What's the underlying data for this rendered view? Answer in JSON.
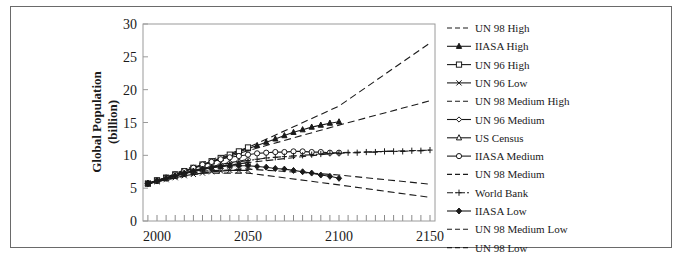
{
  "chart_data": {
    "type": "line",
    "title": "",
    "xlabel": "",
    "ylabel": "Global Population (billion)",
    "ylabel_lines": [
      "Global Population",
      "(billion)"
    ],
    "xlim": [
      1995,
      2150
    ],
    "ylim": [
      0,
      30
    ],
    "xticks": [
      2000,
      2050,
      2100,
      2150
    ],
    "yticks": [
      0,
      5,
      10,
      15,
      20,
      25,
      30
    ],
    "minor_xtick_step": 5,
    "grid": false,
    "legend_position": "right",
    "series": [
      {
        "name": "UN 98 High",
        "style": "dash",
        "marker": "none",
        "x": [
          1995,
          2000,
          2025,
          2050,
          2100,
          2150
        ],
        "y": [
          5.7,
          6.1,
          8.9,
          11.2,
          17.5,
          27.1
        ]
      },
      {
        "name": "IIASA High",
        "style": "solid",
        "marker": "triangle-filled",
        "x": [
          1995,
          2000,
          2005,
          2010,
          2015,
          2020,
          2025,
          2030,
          2035,
          2040,
          2045,
          2050,
          2055,
          2060,
          2065,
          2070,
          2075,
          2080,
          2085,
          2090,
          2095,
          2100
        ],
        "y": [
          5.7,
          6.1,
          6.5,
          7.0,
          7.5,
          8.0,
          8.5,
          9.0,
          9.5,
          10.0,
          10.5,
          11.0,
          11.5,
          12.0,
          12.5,
          13.0,
          13.5,
          13.9,
          14.3,
          14.6,
          14.9,
          15.1
        ]
      },
      {
        "name": "UN 96 High",
        "style": "solid",
        "marker": "square-open",
        "x": [
          1995,
          2000,
          2005,
          2010,
          2015,
          2020,
          2025,
          2030,
          2035,
          2040,
          2045,
          2050
        ],
        "y": [
          5.7,
          6.2,
          6.6,
          7.1,
          7.6,
          8.1,
          8.6,
          9.1,
          9.6,
          10.1,
          10.6,
          11.2
        ]
      },
      {
        "name": "UN 96 Low",
        "style": "solid",
        "marker": "x",
        "x": [
          1995,
          2000,
          2005,
          2010,
          2015,
          2020,
          2025,
          2030,
          2035,
          2040,
          2045,
          2050
        ],
        "y": [
          5.7,
          6.0,
          6.3,
          6.6,
          6.9,
          7.1,
          7.3,
          7.5,
          7.6,
          7.7,
          7.7,
          7.7
        ]
      },
      {
        "name": "UN 98 Medium High",
        "style": "dash",
        "marker": "none",
        "x": [
          1995,
          2000,
          2025,
          2050,
          2100,
          2150
        ],
        "y": [
          5.7,
          6.1,
          8.6,
          10.7,
          14.6,
          18.3
        ]
      },
      {
        "name": "UN 96 Medium",
        "style": "solid",
        "marker": "diamond-open",
        "x": [
          1995,
          2000,
          2005,
          2010,
          2015,
          2020,
          2025,
          2030,
          2035,
          2040,
          2045,
          2050
        ],
        "y": [
          5.7,
          6.1,
          6.5,
          6.9,
          7.3,
          7.7,
          8.0,
          8.3,
          8.6,
          8.9,
          9.1,
          9.4
        ]
      },
      {
        "name": "US Census",
        "style": "solid",
        "marker": "triangle-open",
        "x": [
          1995,
          2000,
          2005,
          2010,
          2015,
          2020,
          2025,
          2030,
          2035,
          2040,
          2045,
          2050
        ],
        "y": [
          5.7,
          6.1,
          6.5,
          6.8,
          7.2,
          7.5,
          7.8,
          8.1,
          8.3,
          8.5,
          8.7,
          8.9
        ]
      },
      {
        "name": "IIASA Medium",
        "style": "solid",
        "marker": "circle-open",
        "x": [
          1995,
          2000,
          2005,
          2010,
          2015,
          2020,
          2025,
          2030,
          2035,
          2040,
          2045,
          2050,
          2055,
          2060,
          2065,
          2070,
          2075,
          2080,
          2085,
          2090,
          2095,
          2100
        ],
        "y": [
          5.7,
          6.1,
          6.6,
          7.1,
          7.6,
          8.1,
          8.6,
          9.0,
          9.4,
          9.7,
          9.9,
          10.1,
          10.3,
          10.4,
          10.5,
          10.5,
          10.6,
          10.6,
          10.5,
          10.5,
          10.4,
          10.4
        ]
      },
      {
        "name": "UN 98 Medium",
        "style": "dash",
        "marker": "none",
        "x": [
          1995,
          2000,
          2025,
          2050,
          2100,
          2150
        ],
        "y": [
          5.7,
          6.1,
          8.0,
          8.9,
          10.4,
          10.8
        ]
      },
      {
        "name": "World Bank",
        "style": "dash-dot",
        "marker": "plus",
        "x": [
          1995,
          2000,
          2005,
          2010,
          2015,
          2020,
          2025,
          2030,
          2035,
          2040,
          2045,
          2050,
          2055,
          2060,
          2065,
          2070,
          2075,
          2080,
          2085,
          2090,
          2095,
          2100,
          2105,
          2110,
          2115,
          2120,
          2125,
          2130,
          2135,
          2140,
          2145,
          2150
        ],
        "y": [
          5.7,
          6.1,
          6.5,
          6.9,
          7.3,
          7.6,
          7.9,
          8.2,
          8.5,
          8.8,
          9.0,
          9.2,
          9.4,
          9.6,
          9.7,
          9.8,
          9.9,
          10.0,
          10.1,
          10.2,
          10.3,
          10.3,
          10.4,
          10.4,
          10.5,
          10.5,
          10.6,
          10.6,
          10.6,
          10.7,
          10.7,
          10.8
        ]
      },
      {
        "name": "IIASA Low",
        "style": "solid",
        "marker": "diamond-filled",
        "x": [
          1995,
          2000,
          2005,
          2010,
          2015,
          2020,
          2025,
          2030,
          2035,
          2040,
          2045,
          2050,
          2055,
          2060,
          2065,
          2070,
          2075,
          2080,
          2085,
          2090,
          2095,
          2100
        ],
        "y": [
          5.7,
          6.1,
          6.5,
          6.9,
          7.3,
          7.6,
          7.9,
          8.1,
          8.3,
          8.4,
          8.4,
          8.4,
          8.3,
          8.2,
          8.0,
          7.9,
          7.7,
          7.5,
          7.3,
          7.0,
          6.8,
          6.5
        ]
      },
      {
        "name": "UN 98 Medium Low",
        "style": "dash",
        "marker": "none",
        "x": [
          1995,
          2000,
          2025,
          2050,
          2100,
          2150
        ],
        "y": [
          5.7,
          6.0,
          7.6,
          7.9,
          7.0,
          5.6
        ]
      },
      {
        "name": "UN 98 Low",
        "style": "dash",
        "marker": "none",
        "x": [
          1995,
          2000,
          2025,
          2050,
          2100,
          2150
        ],
        "y": [
          5.7,
          6.0,
          7.3,
          7.3,
          5.5,
          3.6
        ]
      }
    ]
  },
  "colors": {
    "line": "#1a1a1a",
    "frame": "#6a6a6a",
    "axis": "#8a8a8a",
    "background": "#ffffff"
  }
}
